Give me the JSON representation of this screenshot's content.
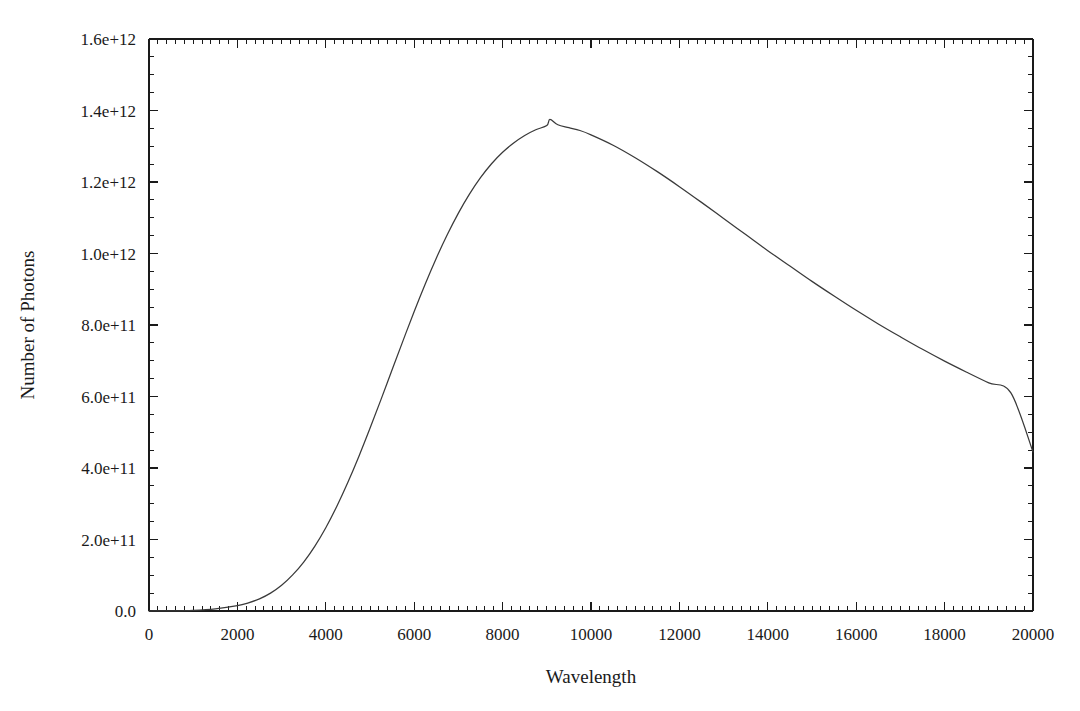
{
  "figure": {
    "title": "",
    "background_color": "#ffffff",
    "width": 1080,
    "height": 711
  },
  "axes": {
    "x_title": "Wavelength",
    "y_title": "Number of Photons",
    "x_tick_labels": [
      "0",
      "2000",
      "4000",
      "6000",
      "8000",
      "10000",
      "12000",
      "14000",
      "16000",
      "18000",
      "20000"
    ],
    "y_tick_labels": [
      "0.0",
      "2.0e+11",
      "4.0e+11",
      "6.0e+11",
      "8.0e+11",
      "1.0e+12",
      "1.2e+12",
      "1.4e+12",
      "1.6e+12"
    ],
    "curve_color": "#3a3a3a",
    "axis_color": "#1a1a1a"
  },
  "chart_data": {
    "type": "line",
    "title": "",
    "xlabel": "Wavelength",
    "ylabel": "Number of Photons",
    "xlim": [
      0,
      20000
    ],
    "ylim": [
      0,
      1600000000000
    ],
    "grid": false,
    "legend": false,
    "x_major_step": 2000,
    "y_major_step": 200000000000,
    "x_minor_per_major": 10,
    "y_minor_per_major": 4,
    "x_tick_values": [
      0,
      2000,
      4000,
      6000,
      8000,
      10000,
      12000,
      14000,
      16000,
      18000,
      20000
    ],
    "y_tick_values": [
      0,
      200000000000,
      400000000000,
      600000000000,
      800000000000,
      1000000000000,
      1200000000000,
      1400000000000,
      1600000000000
    ],
    "peak": {
      "x": 9070,
      "y": 1375000000000
    },
    "series": [
      {
        "name": "Number of Photons",
        "color": "#3a3a3a",
        "x": [
          0,
          500,
          1000,
          1500,
          2000,
          2250,
          2500,
          2750,
          3000,
          3250,
          3500,
          3750,
          4000,
          4250,
          4500,
          4750,
          5000,
          5250,
          5500,
          5750,
          6000,
          6250,
          6500,
          6750,
          7000,
          7250,
          7500,
          7750,
          8000,
          8250,
          8500,
          8750,
          9000,
          9070,
          9250,
          9500,
          9750,
          10000,
          10500,
          11000,
          11500,
          12000,
          12500,
          13000,
          13500,
          14000,
          14500,
          15000,
          15500,
          16000,
          16500,
          17000,
          17500,
          18000,
          18500,
          19000,
          19500,
          20000
        ],
        "y": [
          0,
          300000000,
          1800000000,
          6000000000,
          15000000000,
          23000000000,
          34000000000,
          50000000000,
          72000000000,
          101000000000,
          137000000000,
          181000000000,
          233000000000,
          293000000000,
          360000000000,
          433000000000,
          511000000000,
          592000000000,
          675000000000,
          757000000000,
          838000000000,
          915000000000,
          987000000000,
          1053000000000,
          1113000000000,
          1166000000000,
          1212000000000,
          1251000000000,
          1283000000000,
          1309000000000,
          1330000000000,
          1346000000000,
          1358000000000,
          1375000000000,
          1360000000000,
          1352000000000,
          1344000000000,
          1332000000000,
          1303000000000,
          1268000000000,
          1229000000000,
          1187000000000,
          1143000000000,
          1098000000000,
          1053000000000,
          1008000000000,
          965000000000,
          922000000000,
          881000000000,
          841000000000,
          803000000000,
          767000000000,
          732000000000,
          699000000000,
          668000000000,
          638000000000,
          610000000000,
          445000000000
        ]
      }
    ]
  }
}
